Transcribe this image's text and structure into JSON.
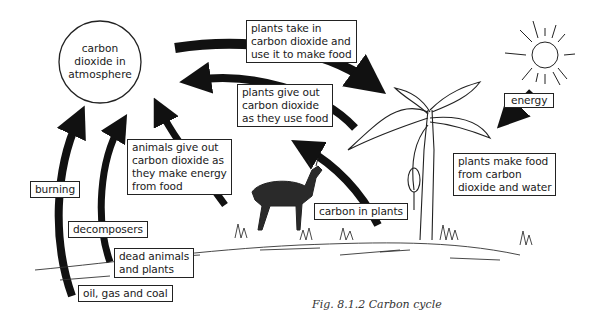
{
  "figure": {
    "caption": "Fig. 8.1.2 Carbon cycle",
    "center_node": "carbon\ndioxide in\natmosphere",
    "labels": {
      "plants_take_in": "plants take in\ncarbon dioxide and\nuse it to make food",
      "plants_give_out": "plants give out\ncarbon dioxide\nas they use food",
      "animals_give_out": "animals give out\ncarbon dioxide as\nthey make energy\nfrom food",
      "energy": "energy",
      "plants_make_food": "plants make food\nfrom carbon\ndioxide and water",
      "carbon_in_plants": "carbon in plants",
      "burning": "burning",
      "decomposers": "decomposers",
      "dead_animals": "dead animals\nand plants",
      "fossil_fuels": "oil, gas and coal"
    },
    "illustrations": [
      "sun-icon",
      "banana-plant",
      "deer-animal",
      "ground-grass"
    ]
  }
}
